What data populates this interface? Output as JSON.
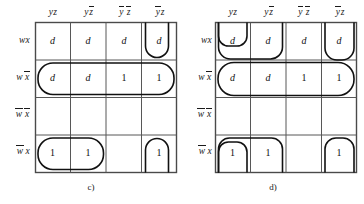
{
  "figure": {
    "maps": [
      {
        "id": "c",
        "caption": "c)",
        "column_headers": [
          {
            "plain": "yz",
            "parts": [
              {
                "t": "y",
                "bar": false
              },
              {
                "t": "z",
                "bar": false
              }
            ]
          },
          {
            "plain": "yz'",
            "parts": [
              {
                "t": "y",
                "bar": false
              },
              {
                "t": "z",
                "bar": true
              }
            ]
          },
          {
            "plain": "y'z'",
            "parts": [
              {
                "t": "y",
                "bar": true
              },
              {
                "t": "z",
                "bar": true
              }
            ]
          },
          {
            "plain": "y'z",
            "parts": [
              {
                "t": "y",
                "bar": true
              },
              {
                "t": "z",
                "bar": false
              }
            ]
          }
        ],
        "row_headers": [
          {
            "plain": "wx",
            "parts": [
              {
                "t": "w",
                "bar": false
              },
              {
                "t": "x",
                "bar": false
              }
            ]
          },
          {
            "plain": "wx'",
            "parts": [
              {
                "t": "w",
                "bar": false
              },
              {
                "t": "x",
                "bar": true
              }
            ]
          },
          {
            "plain": "w'x'",
            "parts": [
              {
                "t": "w",
                "bar": true
              },
              {
                "t": "x",
                "bar": true
              }
            ]
          },
          {
            "plain": "w'x",
            "parts": [
              {
                "t": "w",
                "bar": true
              },
              {
                "t": "x",
                "bar": false
              }
            ]
          }
        ],
        "cells": [
          [
            "d",
            "d",
            "d",
            "d"
          ],
          [
            "d",
            "d",
            "1",
            "1"
          ],
          [
            "",
            "",
            "",
            ""
          ],
          [
            "1",
            "1",
            "",
            "1"
          ]
        ],
        "groups": [
          {
            "name": "wrap-column-4-rows-1-and-4",
            "cells": [
              "r1c4",
              "r4c4"
            ]
          },
          {
            "name": "row-2-all-four-cells",
            "cells": [
              "r2c1",
              "r2c2",
              "r2c3",
              "r2c4"
            ]
          },
          {
            "name": "row-4-cells-1-and-2",
            "cells": [
              "r4c1",
              "r4c2"
            ]
          }
        ]
      },
      {
        "id": "d",
        "caption": "d)",
        "column_headers": [
          {
            "plain": "yz",
            "parts": [
              {
                "t": "y",
                "bar": false
              },
              {
                "t": "z",
                "bar": false
              }
            ]
          },
          {
            "plain": "yz'",
            "parts": [
              {
                "t": "y",
                "bar": false
              },
              {
                "t": "z",
                "bar": true
              }
            ]
          },
          {
            "plain": "y'z'",
            "parts": [
              {
                "t": "y",
                "bar": true
              },
              {
                "t": "z",
                "bar": true
              }
            ]
          },
          {
            "plain": "y'z",
            "parts": [
              {
                "t": "y",
                "bar": true
              },
              {
                "t": "z",
                "bar": false
              }
            ]
          }
        ],
        "row_headers": [
          {
            "plain": "wx",
            "parts": [
              {
                "t": "w",
                "bar": false
              },
              {
                "t": "x",
                "bar": false
              }
            ]
          },
          {
            "plain": "wx'",
            "parts": [
              {
                "t": "w",
                "bar": false
              },
              {
                "t": "x",
                "bar": true
              }
            ]
          },
          {
            "plain": "w'x'",
            "parts": [
              {
                "t": "w",
                "bar": true
              },
              {
                "t": "x",
                "bar": true
              }
            ]
          },
          {
            "plain": "w'x",
            "parts": [
              {
                "t": "w",
                "bar": true
              },
              {
                "t": "x",
                "bar": false
              }
            ]
          }
        ],
        "cells": [
          [
            "d",
            "d",
            "d",
            "d"
          ],
          [
            "d",
            "d",
            "1",
            "1"
          ],
          [
            "",
            "",
            "",
            ""
          ],
          [
            "1",
            "1",
            "",
            "1"
          ]
        ],
        "groups": [
          {
            "name": "column-1-rows-1-2-4-wrap",
            "cells": [
              "r1c1",
              "r2c1",
              "r4c1"
            ]
          },
          {
            "name": "columns-1-2-rows-1-2-4-wrap",
            "cells": [
              "r1c2",
              "r2c2",
              "r4c2"
            ]
          },
          {
            "name": "row-2-full-and-row-1-col-4",
            "cells": [
              "r2c1",
              "r2c2",
              "r2c3",
              "r2c4",
              "r1c4"
            ]
          },
          {
            "name": "column-4-rows-1-2-4-wrap",
            "cells": [
              "r1c4",
              "r2c4",
              "r4c4"
            ]
          }
        ]
      }
    ]
  }
}
